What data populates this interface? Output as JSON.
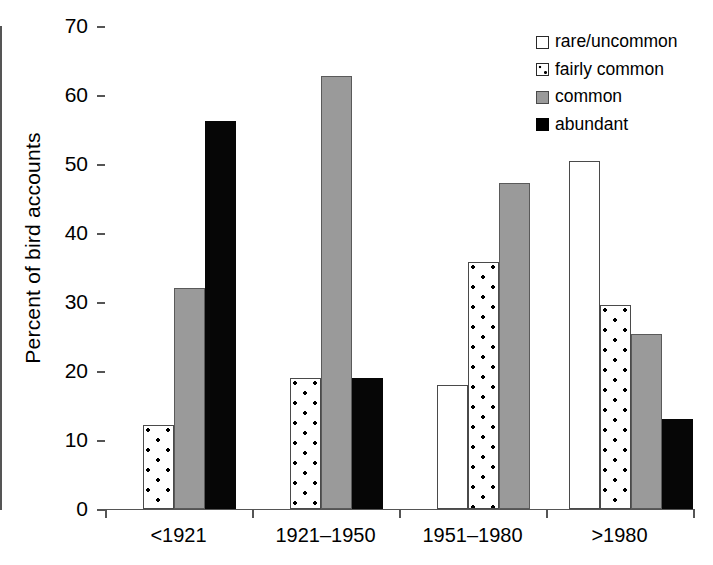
{
  "chart_data": {
    "type": "bar",
    "title": "",
    "xlabel": "",
    "ylabel": "Percent of bird accounts",
    "ylim": [
      0,
      70
    ],
    "yticks": [
      0,
      10,
      20,
      30,
      40,
      50,
      60,
      70
    ],
    "grid": false,
    "legend_position": "top-right",
    "categories": [
      "<1921",
      "1921–1950",
      "1951–1980",
      ">1980"
    ],
    "series": [
      {
        "name": "rare/uncommon",
        "style": "white-outline",
        "color": "#ffffff",
        "values": [
          0,
          0,
          18.0,
          50.5
        ]
      },
      {
        "name": "fairly common",
        "style": "white-dotted",
        "color": "#ffffff",
        "values": [
          12.2,
          19.0,
          35.8,
          29.6
        ]
      },
      {
        "name": "common",
        "style": "gray-fill",
        "color": "#9a9a9a",
        "values": [
          32.0,
          62.7,
          47.2,
          25.4
        ]
      },
      {
        "name": "abundant",
        "style": "black-fill",
        "color": "#000000",
        "values": [
          56.2,
          19.0,
          0,
          13.0
        ]
      }
    ]
  },
  "axis": {
    "y_tick_labels": [
      "0",
      "10",
      "20",
      "30",
      "40",
      "50",
      "60",
      "70"
    ],
    "x_tick_labels": [
      "<1921",
      "1921–1950",
      "1951–1980",
      ">1980"
    ],
    "y_axis_title": "Percent of bird accounts"
  },
  "legend": {
    "items": [
      {
        "label": "rare/uncommon",
        "swatch": "white-outline-swatch"
      },
      {
        "label": "fairly common",
        "swatch": "white-dotted-swatch"
      },
      {
        "label": "common",
        "swatch": "gray-swatch"
      },
      {
        "label": "abundant",
        "swatch": "black-swatch"
      }
    ]
  }
}
